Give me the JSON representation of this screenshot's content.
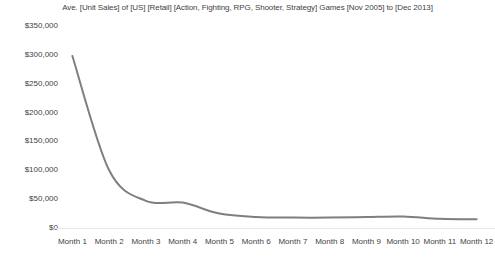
{
  "chart_data": {
    "type": "line",
    "title": "Ave. [Unit Sales] of [US] [Retail] [Action, Fighting, RPG, Shooter, Strategy] Games [Nov 2005] to [Dec 2013]",
    "xlabel": "",
    "ylabel": "",
    "categories": [
      "Month 1",
      "Month 2",
      "Month 3",
      "Month 4",
      "Month 5",
      "Month 6",
      "Month 7",
      "Month 8",
      "Month 9",
      "Month 10",
      "Month 11",
      "Month 12"
    ],
    "values": [
      298000,
      100000,
      47000,
      44000,
      25000,
      19000,
      18000,
      18000,
      19000,
      20000,
      16000,
      15000
    ],
    "series": [
      {
        "name": "Ave. Unit Sales",
        "values": [
          298000,
          100000,
          47000,
          44000,
          25000,
          19000,
          18000,
          18000,
          19000,
          20000,
          16000,
          15000
        ],
        "color": "#7f7f7f"
      }
    ],
    "ylim": [
      0,
      350000
    ],
    "y_ticks": [
      350000,
      300000,
      250000,
      200000,
      150000,
      100000,
      50000,
      0
    ],
    "y_tick_labels": [
      "$350,000",
      "$300,000",
      "$250,000",
      "$200,000",
      "$150,000",
      "$100,000",
      "$50,000",
      "$0"
    ],
    "grid": false,
    "legend": "none",
    "line_color": "#7f7f7f",
    "axis_color": "#e8e8e8",
    "markers": false,
    "smoothing": "spline"
  },
  "axes": {
    "y_labels": [
      "$350,000",
      "$300,000",
      "$250,000",
      "$200,000",
      "$150,000",
      "$100,000",
      "$50,000",
      "$0"
    ],
    "x_labels": [
      "Month 1",
      "Month 2",
      "Month 3",
      "Month 4",
      "Month 5",
      "Month 6",
      "Month 7",
      "Month 8",
      "Month 9",
      "Month 10",
      "Month 11",
      "Month 12"
    ]
  }
}
